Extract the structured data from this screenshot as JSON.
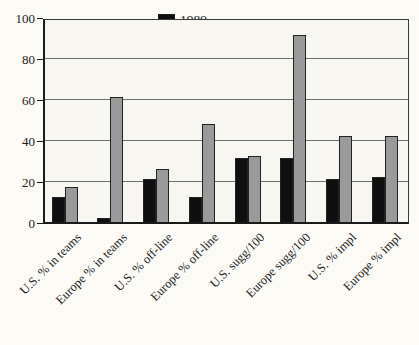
{
  "figure": {
    "background": "#fbfaf5"
  },
  "chart_data": {
    "type": "bar",
    "title": "",
    "xlabel": "",
    "ylabel": "",
    "categories": [
      "U.S. % in teams",
      "Europe % in teams",
      "U.S. % off-line",
      "Europe % off-line",
      "U.S. sugg/100",
      "Europe sugg/100",
      "U.S. % impl",
      "Europe % impl"
    ],
    "series": [
      {
        "name": "1989",
        "color": "#0f0f0f",
        "values": [
          12,
          2,
          21,
          12,
          31,
          31,
          21,
          22
        ]
      },
      {
        "name": "1994",
        "color": "#9a9a9a",
        "values": [
          17,
          61,
          26,
          48,
          32,
          91,
          42,
          42
        ]
      }
    ],
    "ylim": [
      0,
      100
    ],
    "yticks": [
      0,
      20,
      40,
      60,
      80,
      100
    ],
    "grid": true,
    "legend_position": "top-center"
  }
}
